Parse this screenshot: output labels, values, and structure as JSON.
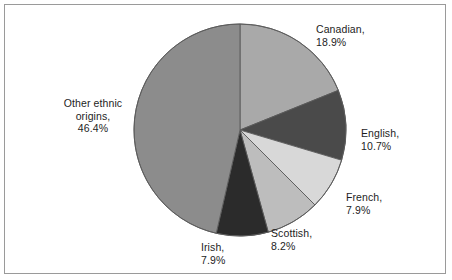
{
  "chart_data": {
    "type": "pie",
    "title": "",
    "subtitle": "",
    "xlabel": "",
    "ylabel": "",
    "grid": false,
    "legend_position": "none",
    "label_format": "{name},\n{value}%",
    "start_angle_deg": 0,
    "direction": "clockwise",
    "categories": [
      "Canadian",
      "English",
      "French",
      "Scottish",
      "Irish",
      "Other ethnic origins"
    ],
    "values": [
      18.9,
      10.7,
      7.9,
      8.2,
      7.9,
      46.4
    ],
    "units": "%",
    "total": 100.0,
    "slices": [
      {
        "name": "Canadian",
        "value": 18.9,
        "value_text": "18.9%",
        "color": "#a9a9a9",
        "label_line1": "Canadian,",
        "label_line2": "18.9%"
      },
      {
        "name": "English",
        "value": 10.7,
        "value_text": "10.7%",
        "color": "#4a4a4a",
        "label_line1": "English,",
        "label_line2": "10.7%"
      },
      {
        "name": "French",
        "value": 7.9,
        "value_text": "7.9%",
        "color": "#d8d8d8",
        "label_line1": "French,",
        "label_line2": "7.9%"
      },
      {
        "name": "Scottish",
        "value": 8.2,
        "value_text": "8.2%",
        "color": "#bdbdbd",
        "label_line1": "Scottish,",
        "label_line2": "8.2%"
      },
      {
        "name": "Irish",
        "value": 7.9,
        "value_text": "7.9%",
        "color": "#2b2b2b",
        "label_line1": "Irish,",
        "label_line2": "7.9%"
      },
      {
        "name": "Other ethnic origins",
        "value": 46.4,
        "value_text": "46.4%",
        "color": "#8c8c8c",
        "label_line1": "Other ethnic",
        "label_line2": "origins,",
        "label_line3": "46.4%"
      }
    ],
    "colors": {
      "background": "#ffffff",
      "border": "#9a9a9a",
      "slice_outline": "#5a5a5a",
      "text": "#1d1d1d"
    }
  }
}
